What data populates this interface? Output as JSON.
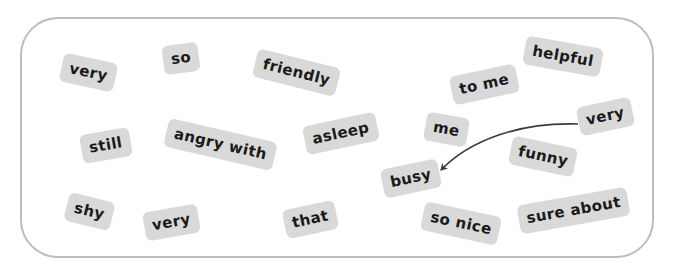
{
  "board": {
    "border_color": "#bdbdbd",
    "chip_color": "#d9d9d9",
    "text_color": "#1a1a1a",
    "arrow_color": "#3a3a3a"
  },
  "chips": [
    {
      "id": "very-1",
      "label": "very",
      "cx": 88,
      "cy": 72,
      "rot": 12
    },
    {
      "id": "so",
      "label": "so",
      "cx": 181,
      "cy": 58,
      "rot": -8
    },
    {
      "id": "friendly",
      "label": "friendly",
      "cx": 296,
      "cy": 72,
      "rot": 14
    },
    {
      "id": "helpful",
      "label": "helpful",
      "cx": 563,
      "cy": 56,
      "rot": 10
    },
    {
      "id": "to-me",
      "label": "to me",
      "cx": 484,
      "cy": 84,
      "rot": -12
    },
    {
      "id": "very-2",
      "label": "very",
      "cx": 605,
      "cy": 116,
      "rot": -12
    },
    {
      "id": "still",
      "label": "still",
      "cx": 106,
      "cy": 145,
      "rot": -10
    },
    {
      "id": "angry-with",
      "label": "angry with",
      "cx": 220,
      "cy": 144,
      "rot": 13
    },
    {
      "id": "asleep",
      "label": "asleep",
      "cx": 341,
      "cy": 133,
      "rot": -12
    },
    {
      "id": "me",
      "label": "me",
      "cx": 446,
      "cy": 129,
      "rot": 10
    },
    {
      "id": "funny",
      "label": "funny",
      "cx": 543,
      "cy": 156,
      "rot": 12
    },
    {
      "id": "busy",
      "label": "busy",
      "cx": 411,
      "cy": 178,
      "rot": -12
    },
    {
      "id": "shy",
      "label": "shy",
      "cx": 89,
      "cy": 211,
      "rot": 14
    },
    {
      "id": "very-3",
      "label": "very",
      "cx": 171,
      "cy": 222,
      "rot": -10
    },
    {
      "id": "that",
      "label": "that",
      "cx": 310,
      "cy": 219,
      "rot": -12
    },
    {
      "id": "so-nice",
      "label": "so nice",
      "cx": 461,
      "cy": 223,
      "rot": 12
    },
    {
      "id": "sure-about",
      "label": "sure about",
      "cx": 573,
      "cy": 210,
      "rot": -10
    }
  ],
  "arrow": {
    "from": "very-2",
    "to": "busy",
    "path": "M 578 124 C 520 122, 470 140, 441 170"
  }
}
